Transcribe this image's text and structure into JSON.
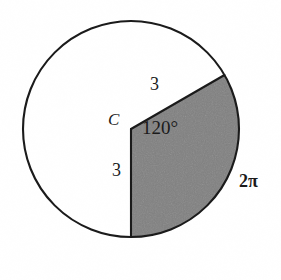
{
  "figure": {
    "type": "circle-sector-diagram",
    "background_color": "#ffffff",
    "outline_color": "#1a1a1a",
    "sector_fill_color": "#808080",
    "circle": {
      "center_x": 131,
      "center_y": 129,
      "radius": 108
    },
    "sector": {
      "angle_degrees": 120,
      "start_angle_degrees": -30,
      "end_angle_degrees": 90,
      "radius_endpoint_upper_x": 222,
      "radius_endpoint_upper_y": 74,
      "radius_endpoint_lower_x": 131,
      "radius_endpoint_lower_y": 237
    },
    "labels": {
      "center_point": "C",
      "radius_upper": "3",
      "radius_lower": "3",
      "central_angle": "120°",
      "arc_length": "2π"
    }
  }
}
